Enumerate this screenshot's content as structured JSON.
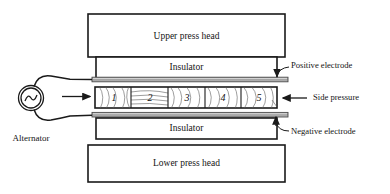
{
  "diagram": {
    "upper_press_head": {
      "label": "Upper press head"
    },
    "upper_insulator": {
      "label": "Insulator"
    },
    "lower_insulator": {
      "label": "Insulator"
    },
    "lower_press_head": {
      "label": "Lower press head"
    },
    "positive_electrode": {
      "label": "Positive  electrode"
    },
    "negative_electrode": {
      "label": "Negative  electrode"
    },
    "side_pressure": {
      "label": "Side  pressure"
    },
    "alternator": {
      "label": "Alternator",
      "symbol": "sine-wave"
    },
    "specimen_cells": [
      {
        "label": "1"
      },
      {
        "label": "2"
      },
      {
        "label": "3"
      },
      {
        "label": "4"
      },
      {
        "label": "5"
      }
    ],
    "colors": {
      "outline": "#1a1a1a",
      "electrode_fill": "#a8a8a8",
      "electrode_stroke": "#4a4a4a",
      "background": "#ffffff",
      "grain": "#5d5d5d"
    }
  }
}
